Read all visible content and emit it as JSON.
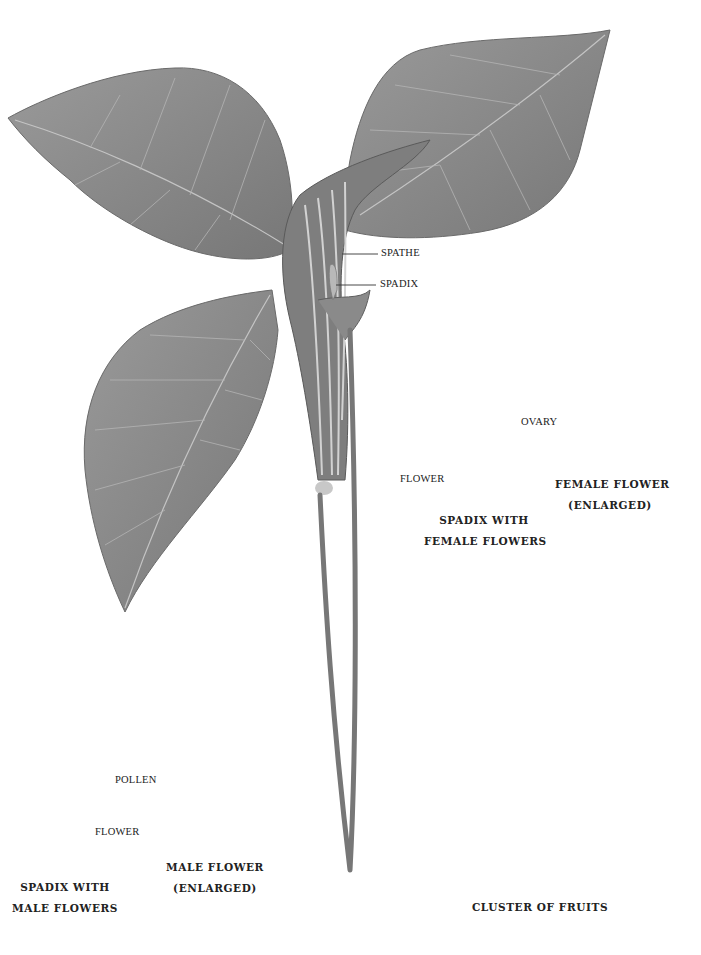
{
  "plate": {
    "subject": "Jack-in-the-pulpit botanical illustration",
    "colors": {
      "background": "#ffffff",
      "leaf": "#8a8a8a",
      "leaf_dark": "#5e5e5e",
      "vein": "#c4c4c4",
      "fruit": "#5a5a5a",
      "text": "#222222"
    }
  },
  "main_plant": {
    "labels": {
      "spathe": "SPATHE",
      "spadix": "SPADIX"
    }
  },
  "female_spadix": {
    "labels": {
      "flower": "FLOWER"
    },
    "caption": {
      "line1": "SPADIX WITH",
      "line2": "FEMALE FLOWERS"
    }
  },
  "female_flower": {
    "labels": {
      "ovary": "OVARY"
    },
    "caption": {
      "line1": "FEMALE FLOWER",
      "line2": "(ENLARGED)"
    }
  },
  "male_spadix": {
    "labels": {
      "flower": "FLOWER"
    },
    "caption": {
      "line1": "SPADIX WITH",
      "line2": "MALE FLOWERS"
    }
  },
  "male_flower": {
    "labels": {
      "pollen": "POLLEN"
    },
    "caption": {
      "line1": "MALE FLOWER",
      "line2": "(ENLARGED)"
    }
  },
  "fruit_cluster": {
    "caption": "CLUSTER OF FRUITS"
  }
}
